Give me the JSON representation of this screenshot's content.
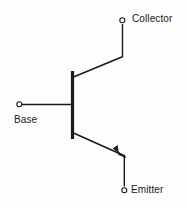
{
  "diagram": {
    "type": "npn-transistor-schematic",
    "background_color": "#fdfdfd",
    "line_color": "#1a1a1a",
    "text_color": "#1a1a1a",
    "terminals": [
      {
        "id": "collector",
        "label": "Collector",
        "node_x": 122,
        "node_y": 20,
        "label_x": 132,
        "label_y": 14
      },
      {
        "id": "base",
        "label": "Base",
        "node_x": 19,
        "node_y": 104,
        "label_x": 14,
        "label_y": 115
      },
      {
        "id": "emitter",
        "label": "Emitter",
        "node_x": 124,
        "node_y": 190,
        "label_x": 131,
        "label_y": 185
      }
    ],
    "base_bar": {
      "x": 72,
      "y_top": 71,
      "y_bottom": 139,
      "thickness": 3
    },
    "arrow": {
      "on": "emitter",
      "direction": "outward",
      "tip_x": 126,
      "tip_y": 157
    }
  }
}
